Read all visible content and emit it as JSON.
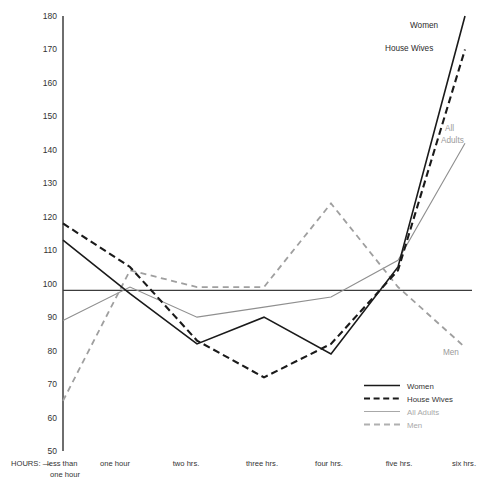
{
  "chart_data": {
    "type": "line",
    "title": "",
    "subtitle": "",
    "xlabel": "HOURS:",
    "ylabel": "",
    "grid": false,
    "legend_position": "inside-bottom-right",
    "ylim": [
      50,
      180
    ],
    "ytick_step": 10,
    "ytick_labels": [
      "180",
      "170",
      "160",
      "150",
      "140",
      "130",
      "120",
      "110",
      "100",
      "90",
      "80",
      "70",
      "60",
      "50"
    ],
    "yticks": [
      180,
      170,
      160,
      150,
      140,
      130,
      120,
      110,
      100,
      90,
      80,
      70,
      60,
      50
    ],
    "baseline_value": 98,
    "categories": [
      "less than one hour",
      "one hour",
      "two hrs.",
      "three hrs.",
      "four hrs.",
      "five hrs.",
      "six hrs."
    ],
    "x_tick_labels": [
      "less than\none hour",
      "one hour",
      "two hrs.",
      "three hrs.",
      "four hrs.",
      "five hrs.",
      "six hrs."
    ],
    "x_axis_prefix": "HOURS: —",
    "series": [
      {
        "name": "Women",
        "style": "solid",
        "color": "#1a1a1a",
        "values": [
          113,
          97,
          82,
          90,
          79,
          105,
          180
        ]
      },
      {
        "name": "House Wives",
        "style": "dashed",
        "color": "#1a1a1a",
        "values": [
          118,
          105,
          83,
          72,
          82,
          104,
          170
        ]
      },
      {
        "name": "All Adults",
        "style": "solid",
        "color": "#8f8f8f",
        "values": [
          89,
          99,
          90,
          93,
          96,
          107,
          142
        ]
      },
      {
        "name": "Men",
        "style": "dashed",
        "color": "#9f9f9f",
        "values": [
          65,
          104,
          99,
          99,
          124,
          99,
          81
        ]
      }
    ],
    "annotations": [
      {
        "text": "Women",
        "series": "Women",
        "color": "#2b2b2b"
      },
      {
        "text": "House Wives",
        "series": "House Wives",
        "color": "#2b2b2b"
      },
      {
        "text": "All",
        "series": "All Adults",
        "color": "#9a9a9a"
      },
      {
        "text": "Adults",
        "series": "All Adults",
        "color": "#9a9a9a"
      },
      {
        "text": "Men",
        "series": "Men",
        "color": "#9a9a9a"
      }
    ]
  },
  "legend": {
    "items": [
      {
        "label": "Women",
        "style": "solid",
        "color": "#1a1a1a"
      },
      {
        "label": "House Wives",
        "style": "dashed",
        "color": "#1a1a1a"
      },
      {
        "label": "All Adults",
        "style": "solid",
        "color": "#a8a8a8"
      },
      {
        "label": "Men",
        "style": "dashed",
        "color": "#b0b0b0"
      }
    ]
  },
  "axis": {
    "y_labels": {
      "t180": "180",
      "t170": "170",
      "t160": "160",
      "t150": "150",
      "t140": "140",
      "t130": "130",
      "t120": "120",
      "t110": "110",
      "t100": "100",
      "t90": "90",
      "t80": "80",
      "t70": "70",
      "t60": "60",
      "t50": "50"
    },
    "x_labels": {
      "prefix": "HOURS: —",
      "c0_line1": "less than",
      "c0_line2": "one hour",
      "c1": "one hour",
      "c2": "two hrs.",
      "c3": "three hrs.",
      "c4": "four hrs.",
      "c5": "five hrs.",
      "c6": "six hrs."
    }
  },
  "annotation_text": {
    "women": "Women",
    "house_wives": "House Wives",
    "all_line1": "All",
    "all_line2": "Adults",
    "men": "Men"
  }
}
